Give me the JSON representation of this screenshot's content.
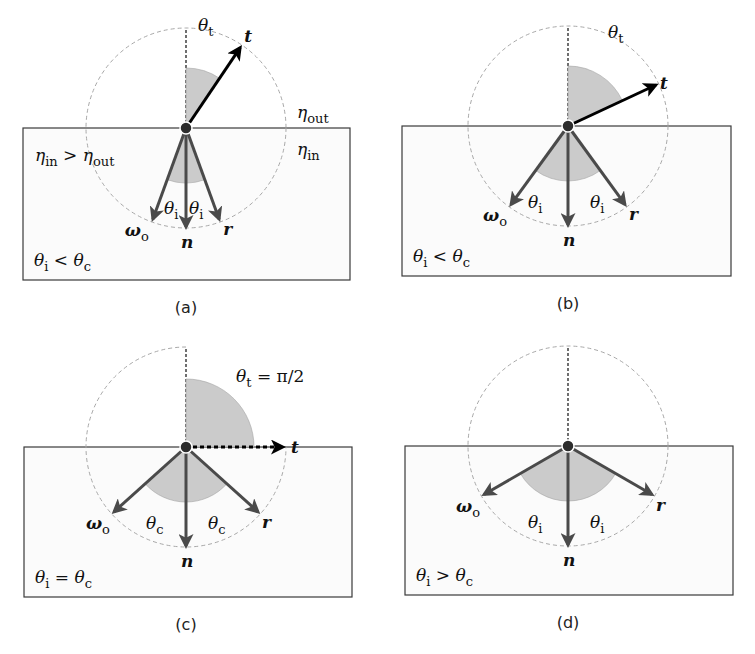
{
  "figure": {
    "colors": {
      "box_fill": "#fbfbfb",
      "box_stroke": "#3a3a3a",
      "wedge_fill": "#c9c9c9",
      "incident_arrow": "#4a4a4a",
      "transmitted_arrow": "#000000",
      "dashed_circle": "#a8a8a8"
    },
    "panels": [
      {
        "id": "a",
        "caption": "(a)",
        "condition": "θi < θc",
        "cx": 186,
        "cy": 128,
        "r": 100,
        "box": {
          "x": 23,
          "y": 128,
          "w": 327,
          "h": 152
        },
        "circle_arcs": "full",
        "incident_angle_deg": 20,
        "transmitted_angle_deg": 34,
        "transmitted_style": "solid",
        "labels": {
          "t": "t",
          "theta_t": "θt",
          "omega_o": "ωo",
          "n": "n",
          "r": "r",
          "theta_left": "θi",
          "theta_right": "θi",
          "eta_out": "ηout",
          "eta_in": "ηin",
          "eta_relation": "ηin > ηout"
        }
      },
      {
        "id": "b",
        "caption": "(b)",
        "condition": "θi < θc",
        "cx": 568,
        "cy": 126,
        "r": 100,
        "box": {
          "x": 402,
          "y": 126,
          "w": 329,
          "h": 150
        },
        "circle_arcs": "full",
        "incident_angle_deg": 36,
        "transmitted_angle_deg": 65,
        "transmitted_style": "solid",
        "labels": {
          "t": "t",
          "theta_t": "θt",
          "omega_o": "ωo",
          "n": "n",
          "r": "r",
          "theta_left": "θi",
          "theta_right": "θi"
        }
      },
      {
        "id": "c",
        "caption": "(c)",
        "condition": "θi = θc",
        "cx": 186,
        "cy": 447,
        "r": 100,
        "box": {
          "x": 24,
          "y": 447,
          "w": 328,
          "h": 150
        },
        "circle_arcs": "no-upper-right",
        "incident_angle_deg": 48,
        "transmitted_angle_deg": 90,
        "transmitted_style": "dotted",
        "labels": {
          "t": "t",
          "theta_t": "θt = π/2",
          "omega_o": "ωo",
          "n": "n",
          "r": "r",
          "theta_left": "θc",
          "theta_right": "θc"
        }
      },
      {
        "id": "d",
        "caption": "(d)",
        "condition": "θi > θc",
        "cx": 568,
        "cy": 446,
        "r": 100,
        "box": {
          "x": 405,
          "y": 446,
          "w": 328,
          "h": 149
        },
        "circle_arcs": "full",
        "incident_angle_deg": 60,
        "transmitted_angle_deg": null,
        "transmitted_style": "none",
        "labels": {
          "omega_o": "ωo",
          "n": "n",
          "r": "r",
          "theta_left": "θi",
          "theta_right": "θi"
        }
      }
    ]
  }
}
